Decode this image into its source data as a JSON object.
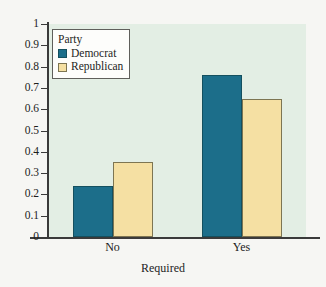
{
  "chart_data": {
    "type": "bar",
    "title": "",
    "xlabel": "Required",
    "ylabel": "",
    "categories": [
      "No",
      "Yes"
    ],
    "series": [
      {
        "name": "Democrat",
        "values": [
          0.24,
          0.76
        ],
        "color": "#1c6e8a"
      },
      {
        "name": "Republican",
        "values": [
          0.35,
          0.65
        ],
        "color": "#f5e0a3"
      }
    ],
    "ylim": [
      0,
      1
    ],
    "ytick_labels": [
      "0",
      "0.1",
      "0.2",
      "0.3",
      "0.4",
      "0.5",
      "0.6",
      "0.7",
      "0.8",
      "0.9",
      "1"
    ],
    "ytick_values": [
      0,
      0.1,
      0.2,
      0.3,
      0.4,
      0.5,
      0.6,
      0.7,
      0.8,
      0.9,
      1
    ],
    "grid": false,
    "legend": {
      "title": "Party",
      "position": "top-left-inside",
      "entries": [
        "Democrat",
        "Republican"
      ]
    },
    "plot_background": "#e3eee4",
    "figure_background": "#f6f6f3"
  }
}
